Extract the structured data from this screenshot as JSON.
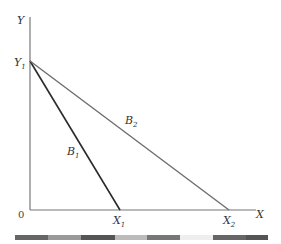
{
  "diagram": {
    "axes": {
      "y_label": "Y",
      "x_label": "X",
      "origin_label": "0",
      "y_intercept_label": "Y",
      "y_intercept_sub": "1",
      "x1_label": "X",
      "x1_sub": "1",
      "x2_label": "X",
      "x2_sub": "2"
    },
    "lines": [
      {
        "name": "B",
        "sub": "1",
        "from": "Y1",
        "to": "X1",
        "color": "#2a2a2a"
      },
      {
        "name": "B",
        "sub": "2",
        "from": "Y1",
        "to": "X2",
        "color": "#6e6e6e"
      }
    ],
    "colors": {
      "axis": "#777777",
      "b1": "#2a2a2a",
      "b2": "#6e6e6e"
    }
  },
  "colorbar": {
    "segments": [
      "#666666",
      "#999999",
      "#555555",
      "#bbbbbb",
      "#777777",
      "#e8e8e8",
      "#666666",
      "#555555"
    ]
  }
}
